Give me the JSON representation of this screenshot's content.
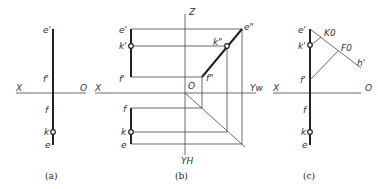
{
  "diagrams": {
    "a": {
      "caption": "(a)",
      "axis_x": "X",
      "axis_o": "O",
      "labels": {
        "e_prime": "e'",
        "f_prime": "f'",
        "f": "f",
        "k": "k",
        "e": "e"
      }
    },
    "b": {
      "caption": "(b)",
      "axis_x": "X",
      "axis_o": "O",
      "axis_z": "Z",
      "axis_yw": "Yw",
      "axis_yh": "YH",
      "labels": {
        "e_prime": "e'",
        "k_prime": "k'",
        "f_prime": "f'",
        "f": "f",
        "k": "k",
        "e": "e",
        "e_dprime": "e\"",
        "k_dprime": "k\"",
        "f_dprime": "f\""
      }
    },
    "c": {
      "caption": "(c)",
      "axis_x": "X",
      "axis_o": "O",
      "labels": {
        "e_prime": "e'",
        "k_prime": "k'",
        "f_prime": "f'",
        "f": "f",
        "k": "k",
        "e": "e",
        "K0": "K0",
        "F0": "F0",
        "h_prime": "h'"
      }
    }
  }
}
